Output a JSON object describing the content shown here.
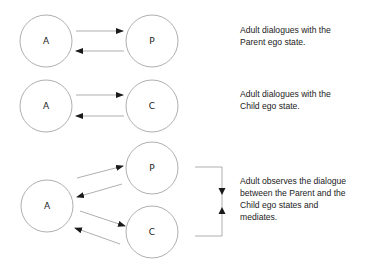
{
  "diagram": {
    "rows": [
      {
        "nodes": [
          {
            "id": "A",
            "label": "A",
            "cx": 46,
            "cy": 41,
            "r": 26
          },
          {
            "id": "P",
            "label": "P",
            "cx": 152,
            "cy": 41,
            "r": 26
          }
        ],
        "caption": [
          "Adult dialogues with the",
          "Parent ego state."
        ]
      },
      {
        "nodes": [
          {
            "id": "A",
            "label": "A",
            "cx": 46,
            "cy": 106,
            "r": 26
          },
          {
            "id": "C",
            "label": "C",
            "cx": 152,
            "cy": 106,
            "r": 26
          }
        ],
        "caption": [
          "Adult dialogues with the",
          "Child ego state."
        ]
      },
      {
        "nodes": [
          {
            "id": "A",
            "label": "A",
            "cx": 47,
            "cy": 206,
            "r": 26
          },
          {
            "id": "P",
            "label": "P",
            "cx": 152,
            "cy": 168,
            "r": 26
          },
          {
            "id": "C",
            "label": "C",
            "cx": 152,
            "cy": 232,
            "r": 26
          }
        ],
        "caption": [
          "Adult observes the dialogue",
          "between the Parent and the",
          "Child ego states and",
          "mediates."
        ]
      }
    ],
    "colors": {
      "stroke": "#9a9a9a",
      "arrow": "#1a1a1a",
      "text": "#222222"
    }
  }
}
